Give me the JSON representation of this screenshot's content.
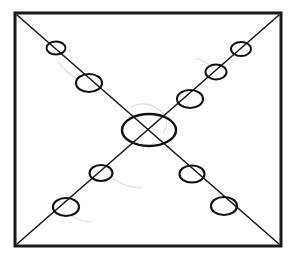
{
  "figure": {
    "title": "",
    "caption": "",
    "background_color": "#ffffff",
    "ink_color": "#1a1a1a",
    "smudge_color": "#dedede",
    "canvas": {
      "width": 294,
      "height": 260
    }
  },
  "frame": {
    "label": "rectangular-border",
    "x": 15,
    "y": 13,
    "width": 266,
    "height": 233,
    "stroke_width": 3,
    "stroke_color": "#1a1a1a"
  },
  "diagonals": [
    {
      "label": "diagonal-nw-se",
      "x1": 17,
      "y1": 15,
      "x2": 279,
      "y2": 244,
      "stroke_width": 1.6
    },
    {
      "label": "diagonal-ne-sw",
      "x1": 279,
      "y1": 15,
      "x2": 17,
      "y2": 244,
      "stroke_width": 1.6
    }
  ],
  "nodes": [
    {
      "label": "center-node",
      "position": "center",
      "cx": 149,
      "cy": 130,
      "rx": 27,
      "ry": 16,
      "stroke_width": 2.4
    },
    {
      "label": "node-nw-inner",
      "position": "northwest-inner",
      "cx": 89,
      "cy": 83,
      "rx": 13,
      "ry": 9,
      "stroke_width": 2.1
    },
    {
      "label": "node-nw-outer",
      "position": "northwest-outer",
      "cx": 56,
      "cy": 48,
      "rx": 9.5,
      "ry": 6.5,
      "stroke_width": 1.9
    },
    {
      "label": "node-ne-inner",
      "position": "northeast-inner",
      "cx": 190,
      "cy": 99,
      "rx": 13,
      "ry": 9,
      "stroke_width": 2.1
    },
    {
      "label": "node-ne-mid",
      "position": "northeast-mid",
      "cx": 216,
      "cy": 72,
      "rx": 10.5,
      "ry": 7.5,
      "stroke_width": 2.0
    },
    {
      "label": "node-ne-outer",
      "position": "northeast-outer",
      "cx": 241,
      "cy": 49,
      "rx": 10,
      "ry": 7,
      "stroke_width": 1.9
    },
    {
      "label": "node-sw-inner",
      "position": "southwest-inner",
      "cx": 101,
      "cy": 173,
      "rx": 11.5,
      "ry": 8,
      "stroke_width": 2.1
    },
    {
      "label": "node-sw-outer",
      "position": "southwest-outer",
      "cx": 66,
      "cy": 207,
      "rx": 13,
      "ry": 9,
      "stroke_width": 2.2
    },
    {
      "label": "node-se-inner",
      "position": "southeast-inner",
      "cx": 192,
      "cy": 174,
      "rx": 12.5,
      "ry": 8.5,
      "stroke_width": 2.1
    },
    {
      "label": "node-se-outer",
      "position": "southeast-outer",
      "cx": 224,
      "cy": 206,
      "rx": 13,
      "ry": 9,
      "stroke_width": 2.2
    }
  ],
  "counts": {
    "total_nodes": 10,
    "nodes_per_arm": [
      2,
      3,
      2,
      2
    ],
    "diagonal_count": 2
  }
}
